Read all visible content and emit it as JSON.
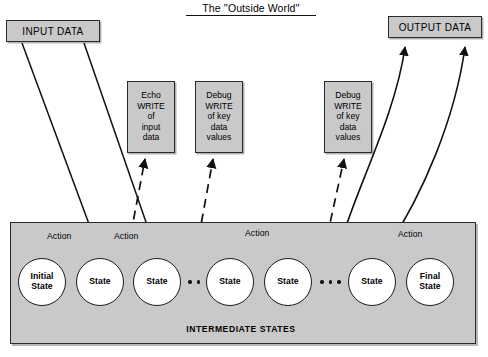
{
  "diagram": {
    "title": "The ''Outside World''",
    "intermediate_label": "INTERMEDIATE STATES",
    "footer_caption": "",
    "colors": {
      "panel_fill": "#c9c9c9",
      "panel_stroke": "#2b2b2b",
      "circle_fill": "#ffffff",
      "ink": "#111111"
    }
  },
  "io_boxes": {
    "input": {
      "label": "INPUT DATA"
    },
    "output": {
      "label": "OUTPUT DATA"
    }
  },
  "notes": [
    {
      "id": "echo",
      "lines": [
        "Echo",
        "WRITE",
        "of",
        "input",
        "data"
      ]
    },
    {
      "id": "debug1",
      "lines": [
        "Debug",
        "WRITE",
        "of key",
        "data",
        "values"
      ]
    },
    {
      "id": "debug2",
      "lines": [
        "Debug",
        "WRITE",
        "of key",
        "data",
        "values"
      ]
    }
  ],
  "states": [
    {
      "id": "initial",
      "line1": "Initial",
      "line2": "State"
    },
    {
      "id": "s1",
      "line1": "State",
      "line2": ""
    },
    {
      "id": "s2",
      "line1": "State",
      "line2": ""
    },
    {
      "id": "s3",
      "line1": "State",
      "line2": ""
    },
    {
      "id": "s4",
      "line1": "State",
      "line2": ""
    },
    {
      "id": "s5",
      "line1": "State",
      "line2": ""
    },
    {
      "id": "final",
      "line1": "Final",
      "line2": "State"
    }
  ],
  "ellipses": [
    {
      "id": "ellipsis-1",
      "count": 2
    },
    {
      "id": "ellipsis-2",
      "count": 3
    }
  ],
  "actions": [
    {
      "id": "action-1",
      "label": "Action"
    },
    {
      "id": "action-2",
      "label": "Action"
    },
    {
      "id": "action-3",
      "label": "Action"
    },
    {
      "id": "action-4",
      "label": "Action"
    }
  ]
}
